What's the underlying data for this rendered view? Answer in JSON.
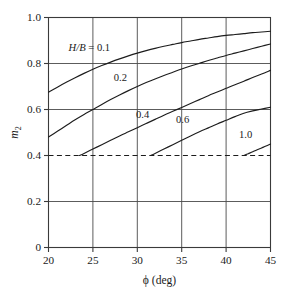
{
  "chart_data": {
    "type": "line",
    "title": "",
    "xlabel": "ϕ (deg)",
    "ylabel": "m2",
    "ylabel_main": "m",
    "ylabel_sub": "2",
    "xlim": [
      20,
      45
    ],
    "ylim": [
      0,
      1.0
    ],
    "xticks": [
      20,
      25,
      30,
      35,
      40,
      45
    ],
    "xticklabels": [
      "20",
      "25",
      "30",
      "35",
      "40",
      "45"
    ],
    "yticks": [
      0,
      0.2,
      0.4,
      0.6,
      0.8,
      1.0
    ],
    "yticklabels": [
      "0",
      "0.2",
      "0.4",
      "0.6",
      "0.8",
      "1.0"
    ],
    "grid": true,
    "grid_style": "solid horizontal and vertical at major ticks",
    "legend_position": "inline curve labels",
    "legend_prefix": "H/B =",
    "legend_prefix_italic": "H/B",
    "legend_prefix_rest": " = 0.1",
    "reference_lines": [
      {
        "name": "m2-floor",
        "orientation": "horizontal",
        "value": 0.4,
        "style": "dashed",
        "label": ""
      }
    ],
    "series": [
      {
        "name": "0.1",
        "label": "H/B = 0.1",
        "label_x": 24.6,
        "label_y": 0.855,
        "x": [
          20,
          21,
          22,
          23,
          24,
          25,
          26,
          27,
          28,
          29,
          30,
          31,
          32,
          33,
          34,
          35,
          36,
          37,
          38,
          39,
          40,
          41,
          42,
          43,
          44,
          45
        ],
        "y": [
          0.675,
          0.697,
          0.718,
          0.738,
          0.757,
          0.775,
          0.791,
          0.806,
          0.82,
          0.833,
          0.845,
          0.856,
          0.866,
          0.875,
          0.883,
          0.891,
          0.898,
          0.905,
          0.911,
          0.917,
          0.922,
          0.926,
          0.93,
          0.934,
          0.937,
          0.94
        ]
      },
      {
        "name": "0.2",
        "label": "0.2",
        "label_x": 28.1,
        "label_y": 0.723,
        "x": [
          20,
          21,
          22,
          23,
          24,
          25,
          26,
          27,
          28,
          29,
          30,
          31,
          32,
          33,
          34,
          35,
          36,
          37,
          38,
          39,
          40,
          41,
          42,
          43,
          44,
          45
        ],
        "y": [
          0.48,
          0.505,
          0.53,
          0.555,
          0.578,
          0.6,
          0.622,
          0.643,
          0.663,
          0.682,
          0.7,
          0.717,
          0.733,
          0.748,
          0.762,
          0.776,
          0.789,
          0.801,
          0.813,
          0.824,
          0.835,
          0.845,
          0.855,
          0.865,
          0.875,
          0.885
        ]
      },
      {
        "name": "0.4",
        "label": "0.4",
        "label_x": 30.6,
        "label_y": 0.565,
        "x": [
          23.5,
          24,
          25,
          26,
          27,
          28,
          29,
          30,
          31,
          32,
          33,
          34,
          35,
          36,
          37,
          38,
          39,
          40,
          41,
          42,
          43,
          44,
          45
        ],
        "y": [
          0.4,
          0.409,
          0.428,
          0.447,
          0.466,
          0.485,
          0.503,
          0.521,
          0.539,
          0.557,
          0.575,
          0.592,
          0.609,
          0.626,
          0.643,
          0.66,
          0.676,
          0.692,
          0.708,
          0.723,
          0.739,
          0.754,
          0.77
        ]
      },
      {
        "name": "0.6",
        "label": "0.6",
        "label_x": 35.1,
        "label_y": 0.543,
        "x": [
          31.5,
          32,
          33,
          34,
          35,
          36,
          37,
          38,
          39,
          40,
          41,
          42,
          43,
          44,
          45
        ],
        "y": [
          0.4,
          0.409,
          0.428,
          0.447,
          0.466,
          0.485,
          0.503,
          0.52,
          0.537,
          0.553,
          0.569,
          0.584,
          0.594,
          0.602,
          0.61
        ]
      },
      {
        "name": "1.0",
        "label": "1.0",
        "label_x": 42.2,
        "label_y": 0.477,
        "x": [
          42,
          42.5,
          43,
          43.5,
          44,
          44.5,
          45
        ],
        "y": [
          0.4,
          0.408,
          0.416,
          0.425,
          0.433,
          0.441,
          0.45
        ]
      }
    ]
  },
  "figure": {
    "xlabel": "ϕ (deg)",
    "ylabel_main": "m",
    "ylabel_sub": "2"
  }
}
